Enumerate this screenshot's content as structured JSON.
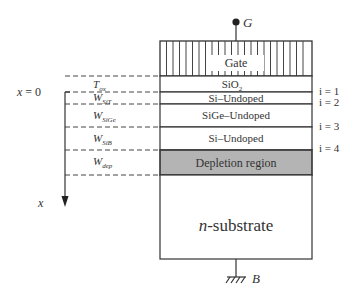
{
  "diagram": {
    "terminals": {
      "gate": "G",
      "body": "B"
    },
    "layers": [
      {
        "id": "gate",
        "label": "Gate",
        "fill": "#ffffff",
        "hatched": true
      },
      {
        "id": "oxide",
        "label_main": "SiO",
        "label_sub": "2",
        "fill": "#ffffff"
      },
      {
        "id": "si-top",
        "label": "Si–Undoped",
        "fill": "#ffffff"
      },
      {
        "id": "sige",
        "label": "SiGe–Undoped",
        "fill": "#ffffff"
      },
      {
        "id": "si-bottom",
        "label": "Si–Undoped",
        "fill": "#ffffff"
      },
      {
        "id": "depletion",
        "label": "Depletion region",
        "fill": "#b4b4b4"
      },
      {
        "id": "substrate",
        "label_italic": "n",
        "label_rest": "-substrate",
        "fill": "#ffffff"
      }
    ],
    "thickness_labels": [
      {
        "main": "T",
        "sub": "ox"
      },
      {
        "main": "W",
        "sub": "SiT"
      },
      {
        "main": "W",
        "sub": "SiGe"
      },
      {
        "main": "W",
        "sub": "SiB"
      },
      {
        "main": "W",
        "sub": "dep"
      }
    ],
    "interface_labels": [
      "i = 1",
      "i = 2",
      "i = 3",
      "i = 4"
    ],
    "axis": {
      "origin_label": "x = 0",
      "axis_label": "x"
    },
    "colors": {
      "line": "#333333",
      "depletion": "#b4b4b4",
      "background": "#ffffff"
    }
  }
}
